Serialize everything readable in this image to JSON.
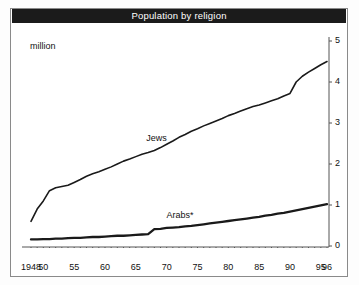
{
  "title": "Population by religion",
  "unit_label": "million",
  "colors": {
    "titlebar_bg": "#1b1b1b",
    "titlebar_text": "#ffffff",
    "line": "#1a1a1a",
    "frame": "#8a8a8a",
    "axis": "#555555"
  },
  "series_labels": {
    "jews": "Jews",
    "arabs": "Arabs*"
  },
  "chart_data": {
    "type": "line",
    "title": "Population by religion",
    "xlabel": "",
    "ylabel": "million",
    "ylim": [
      0,
      5
    ],
    "xlim": [
      1948,
      1996
    ],
    "grid": false,
    "legend": "inline-labels",
    "yticks": [
      "0",
      "1",
      "2",
      "3",
      "4",
      "5"
    ],
    "xticks": [
      "1948",
      "50",
      "55",
      "60",
      "65",
      "70",
      "75",
      "80",
      "85",
      "90",
      "95",
      "96"
    ],
    "xtick_years": [
      1948,
      1950,
      1955,
      1960,
      1965,
      1970,
      1975,
      1980,
      1985,
      1990,
      1995,
      1996
    ],
    "axis_side": "right",
    "note": "* Arabs series steps up in 1967",
    "series": [
      {
        "name": "Jews",
        "x": [
          1948,
          1949,
          1950,
          1951,
          1952,
          1953,
          1954,
          1955,
          1956,
          1957,
          1958,
          1959,
          1960,
          1961,
          1962,
          1963,
          1964,
          1965,
          1966,
          1967,
          1968,
          1969,
          1970,
          1971,
          1972,
          1973,
          1974,
          1975,
          1976,
          1977,
          1978,
          1979,
          1980,
          1981,
          1982,
          1983,
          1984,
          1985,
          1986,
          1987,
          1988,
          1989,
          1990,
          1991,
          1992,
          1993,
          1994,
          1995,
          1996
        ],
        "values": [
          0.6,
          0.9,
          1.1,
          1.35,
          1.42,
          1.45,
          1.48,
          1.55,
          1.62,
          1.7,
          1.76,
          1.81,
          1.87,
          1.93,
          2.0,
          2.07,
          2.12,
          2.18,
          2.24,
          2.28,
          2.33,
          2.4,
          2.48,
          2.56,
          2.65,
          2.72,
          2.8,
          2.86,
          2.93,
          2.99,
          3.05,
          3.11,
          3.18,
          3.23,
          3.29,
          3.35,
          3.4,
          3.44,
          3.49,
          3.54,
          3.59,
          3.66,
          3.72,
          4.0,
          4.14,
          4.24,
          4.33,
          4.42,
          4.5
        ]
      },
      {
        "name": "Arabs*",
        "x": [
          1948,
          1949,
          1950,
          1951,
          1952,
          1953,
          1954,
          1955,
          1956,
          1957,
          1958,
          1959,
          1960,
          1961,
          1962,
          1963,
          1964,
          1965,
          1966,
          1967,
          1968,
          1969,
          1970,
          1971,
          1972,
          1973,
          1974,
          1975,
          1976,
          1977,
          1978,
          1979,
          1980,
          1981,
          1982,
          1983,
          1984,
          1985,
          1986,
          1987,
          1988,
          1989,
          1990,
          1991,
          1992,
          1993,
          1994,
          1995,
          1996
        ],
        "values": [
          0.16,
          0.16,
          0.17,
          0.17,
          0.18,
          0.18,
          0.19,
          0.2,
          0.2,
          0.21,
          0.22,
          0.22,
          0.23,
          0.24,
          0.25,
          0.25,
          0.26,
          0.27,
          0.28,
          0.29,
          0.41,
          0.42,
          0.44,
          0.45,
          0.46,
          0.48,
          0.49,
          0.51,
          0.53,
          0.55,
          0.57,
          0.59,
          0.61,
          0.63,
          0.65,
          0.67,
          0.69,
          0.71,
          0.74,
          0.76,
          0.79,
          0.81,
          0.84,
          0.87,
          0.9,
          0.93,
          0.96,
          0.99,
          1.02
        ]
      }
    ]
  }
}
